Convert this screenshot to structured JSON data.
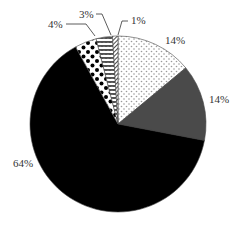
{
  "chart_data": {
    "type": "pie",
    "title": "",
    "start_angle_deg": 0,
    "direction": "clockwise",
    "slices": [
      {
        "label": "14%",
        "value": 14,
        "pattern": "small-dots",
        "fill": "#ffffff",
        "pattern_color": "#999999"
      },
      {
        "label": "14%",
        "value": 14,
        "pattern": "solid",
        "fill": "#4a4a4a"
      },
      {
        "label": "64%",
        "value": 64,
        "pattern": "solid",
        "fill": "#000000"
      },
      {
        "label": "4%",
        "value": 4,
        "pattern": "large-dots",
        "fill": "#ffffff",
        "pattern_color": "#000000"
      },
      {
        "label": "3%",
        "value": 3,
        "pattern": "zigzag",
        "fill": "#ffffff",
        "pattern_color": "#000000"
      },
      {
        "label": "1%",
        "value": 1,
        "pattern": "diagonal-hatch",
        "fill": "#ffffff",
        "pattern_color": "#000000"
      }
    ],
    "legend": null
  },
  "labels": {
    "s0": "14%",
    "s1": "14%",
    "s2": "64%",
    "s3": "4%",
    "s4": "3%",
    "s5": "1%"
  }
}
